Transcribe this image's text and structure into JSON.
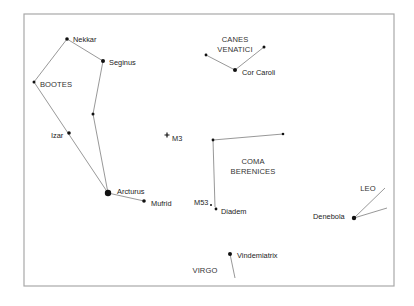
{
  "chart": {
    "frame": {
      "x": 24,
      "y": 14,
      "width": 370,
      "height": 272
    },
    "constellations": [
      {
        "name": "BOOTES",
        "label_lines": [
          "BOOTES"
        ],
        "x": 56,
        "y": 87
      },
      {
        "name": "CANES VENATICI",
        "label_lines": [
          "CANES",
          "VENATICI"
        ],
        "x": 235,
        "y": 42
      },
      {
        "name": "COMA BERENICES",
        "label_lines": [
          "COMA",
          "BERENICES"
        ],
        "x": 253,
        "y": 164
      },
      {
        "name": "LEO",
        "label_lines": [
          "LEO"
        ],
        "x": 368,
        "y": 191
      },
      {
        "name": "VIRGO",
        "label_lines": [
          "VIRGO"
        ],
        "x": 205,
        "y": 273
      }
    ],
    "stars": [
      {
        "id": "nekkar",
        "name": "Nekkar",
        "x": 67,
        "y": 39,
        "r": 1.8,
        "lx": 73,
        "ly": 39
      },
      {
        "id": "seginus",
        "name": "Seginus",
        "x": 103,
        "y": 61,
        "r": 2.0,
        "lx": 109,
        "ly": 62
      },
      {
        "id": "bootes-left",
        "name": "",
        "x": 34,
        "y": 82,
        "r": 1.5
      },
      {
        "id": "bootes-mid",
        "name": "",
        "x": 93,
        "y": 114,
        "r": 1.5
      },
      {
        "id": "izar",
        "name": "Izar",
        "x": 69,
        "y": 133,
        "r": 1.8,
        "lx": 51,
        "ly": 135
      },
      {
        "id": "arcturus",
        "name": "Arcturus",
        "x": 108,
        "y": 193,
        "r": 3.2,
        "lx": 117,
        "ly": 191
      },
      {
        "id": "mufrid",
        "name": "Mufrid",
        "x": 144,
        "y": 201,
        "r": 1.8,
        "lx": 151,
        "ly": 203
      },
      {
        "id": "m3",
        "name": "M3",
        "x": 167,
        "y": 135,
        "r": 0,
        "lx": 172,
        "ly": 138,
        "marker": "cross"
      },
      {
        "id": "canes-left",
        "name": "",
        "x": 206,
        "y": 55,
        "r": 1.4
      },
      {
        "id": "cor-caroli",
        "name": "Cor Caroli",
        "x": 235,
        "y": 70,
        "r": 2.0,
        "lx": 242,
        "ly": 72
      },
      {
        "id": "canes-right",
        "name": "",
        "x": 264,
        "y": 47,
        "r": 1.5
      },
      {
        "id": "coma-left",
        "name": "",
        "x": 213,
        "y": 140,
        "r": 1.4
      },
      {
        "id": "coma-right",
        "name": "",
        "x": 283,
        "y": 134,
        "r": 1.3
      },
      {
        "id": "m53",
        "name": "M53",
        "x": 211,
        "y": 205,
        "r": 1.0,
        "lx": 194,
        "ly": 202
      },
      {
        "id": "diadem",
        "name": "Diadem",
        "x": 216,
        "y": 209,
        "r": 1.4,
        "lx": 221,
        "ly": 211
      },
      {
        "id": "denebola",
        "name": "Denebola",
        "x": 354,
        "y": 218,
        "r": 2.2,
        "lx": 313,
        "ly": 216
      },
      {
        "id": "vindemiatrix",
        "name": "Vindemiatrix",
        "x": 230,
        "y": 254,
        "r": 2.0,
        "lx": 237,
        "ly": 255
      }
    ],
    "lines": [
      {
        "x1": 67,
        "y1": 39,
        "x2": 103,
        "y2": 61
      },
      {
        "x1": 67,
        "y1": 39,
        "x2": 34,
        "y2": 82
      },
      {
        "x1": 34,
        "y1": 82,
        "x2": 108,
        "y2": 193
      },
      {
        "x1": 103,
        "y1": 61,
        "x2": 93,
        "y2": 114
      },
      {
        "x1": 93,
        "y1": 114,
        "x2": 108,
        "y2": 193
      },
      {
        "x1": 108,
        "y1": 193,
        "x2": 144,
        "y2": 201
      },
      {
        "x1": 206,
        "y1": 55,
        "x2": 235,
        "y2": 70
      },
      {
        "x1": 235,
        "y1": 70,
        "x2": 264,
        "y2": 47
      },
      {
        "x1": 213,
        "y1": 140,
        "x2": 283,
        "y2": 134
      },
      {
        "x1": 213,
        "y1": 140,
        "x2": 215,
        "y2": 207
      },
      {
        "x1": 354,
        "y1": 218,
        "x2": 385,
        "y2": 188
      },
      {
        "x1": 354,
        "y1": 218,
        "x2": 387,
        "y2": 208
      },
      {
        "x1": 230,
        "y1": 254,
        "x2": 235,
        "y2": 278
      }
    ]
  }
}
